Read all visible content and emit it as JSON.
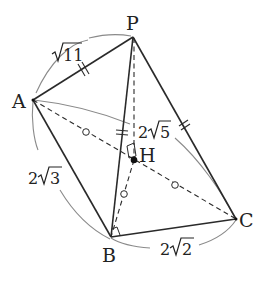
{
  "diagram": {
    "type": "tetrahedron",
    "vertices": {
      "P": {
        "label": "P",
        "x": 133,
        "y": 37
      },
      "A": {
        "label": "A",
        "x": 33,
        "y": 100
      },
      "B": {
        "label": "B",
        "x": 111,
        "y": 237
      },
      "C": {
        "label": "C",
        "x": 236,
        "y": 219
      },
      "H": {
        "label": "H",
        "x": 134,
        "y": 160
      }
    },
    "edges": {
      "PA": {
        "length_label": "√11",
        "style": "solid"
      },
      "AC": {
        "length_label": "2√5",
        "style": "dashed"
      },
      "AB": {
        "length_label": "2√3",
        "style": "solid"
      },
      "BC": {
        "length_label": "2√2",
        "style": "solid"
      },
      "PB": {
        "style": "solid"
      },
      "PC": {
        "style": "solid"
      },
      "PH": {
        "style": "dashed"
      },
      "HB": {
        "style": "dashed"
      }
    },
    "labels": {
      "sqrt11_coef": "",
      "sqrt11_rad": "11",
      "sqrt5_coef": "2",
      "sqrt5_rad": "5",
      "sqrt3_coef": "2",
      "sqrt3_rad": "3",
      "sqrt2_coef": "2",
      "sqrt2_rad": "2"
    },
    "marks": {
      "equal_double_ticks": [
        "PA",
        "PB",
        "PC"
      ],
      "equal_circles": [
        "AH",
        "HC",
        "HB"
      ],
      "right_angles": [
        "PHB",
        "ABC"
      ]
    },
    "colors": {
      "line": "#2a2a2a",
      "arc": "#8a8a8a",
      "text": "#222222"
    }
  }
}
